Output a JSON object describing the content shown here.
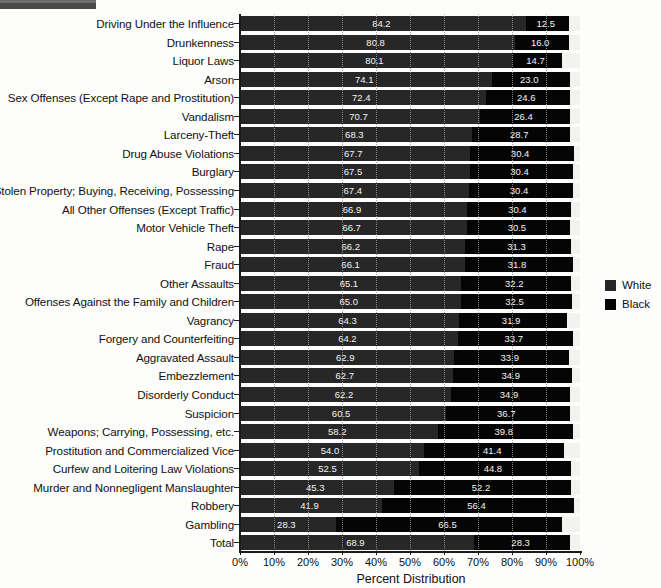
{
  "chart_data": {
    "type": "bar",
    "orientation": "horizontal",
    "stacked": true,
    "normalized": true,
    "title": "",
    "xlabel": "Percent Distribution",
    "ylabel": "",
    "xlim": [
      0,
      100
    ],
    "xticks": [
      "0%",
      "10%",
      "20%",
      "30%",
      "40%",
      "50%",
      "60%",
      "70%",
      "80%",
      "90%",
      "100%"
    ],
    "xtick_values": [
      0,
      10,
      20,
      30,
      40,
      50,
      60,
      70,
      80,
      90,
      100
    ],
    "grid": true,
    "grid_axis": "x",
    "legend_position": "right",
    "categories": [
      "Driving Under the Influence",
      "Drunkenness",
      "Liquor Laws",
      "Arson",
      "Sex Offenses (Except Rape and Prostitution)",
      "Vandalism",
      "Larceny-Theft",
      "Drug Abuse Violations",
      "Burglary",
      "Stolen Property; Buying, Receiving, Possessing",
      "All Other Offenses (Except Traffic)",
      "Motor Vehicle Theft",
      "Rape",
      "Fraud",
      "Other Assaults",
      "Offenses Against the Family and Children",
      "Vagrancy",
      "Forgery and Counterfeiting",
      "Aggravated Assault",
      "Embezzlement",
      "Disorderly Conduct",
      "Suspicion",
      "Weapons; Carrying, Possessing, etc.",
      "Prostitution and Commercialized Vice",
      "Curfew and Loitering Law Violations",
      "Murder and Nonnegligent Manslaughter",
      "Robbery",
      "Gambling",
      "Total"
    ],
    "series": [
      {
        "name": "White",
        "color": "#272727",
        "values": [
          84.2,
          80.8,
          80.1,
          74.1,
          72.4,
          70.7,
          68.3,
          67.7,
          67.5,
          67.4,
          66.9,
          66.7,
          66.2,
          66.1,
          65.1,
          65.0,
          64.3,
          64.2,
          62.9,
          62.7,
          62.2,
          60.5,
          58.2,
          54.0,
          52.5,
          45.3,
          41.9,
          28.3,
          68.9
        ]
      },
      {
        "name": "Black",
        "color": "#050505",
        "values": [
          12.5,
          16.0,
          14.7,
          23.0,
          24.6,
          26.4,
          28.7,
          30.4,
          30.4,
          30.4,
          30.4,
          30.5,
          31.3,
          31.8,
          32.2,
          32.5,
          31.9,
          33.7,
          33.9,
          34.9,
          34.9,
          36.7,
          39.8,
          41.4,
          44.8,
          52.2,
          56.4,
          66.5,
          28.3
        ]
      }
    ]
  },
  "legend": {
    "items": [
      {
        "label": "White",
        "color": "#272727"
      },
      {
        "label": "Black",
        "color": "#050505"
      }
    ]
  }
}
